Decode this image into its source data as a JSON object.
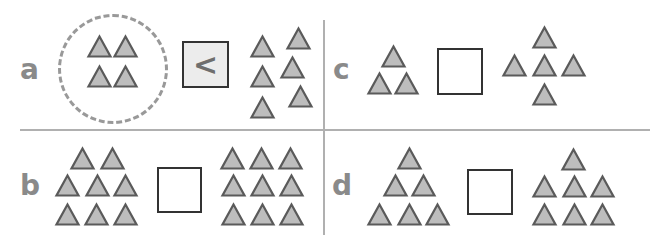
{
  "colors": {
    "triangle_fill": "#bdbdbd",
    "triangle_stroke": "#5a5a5a",
    "label": "#8a8a8a",
    "divider": "#b0b0b0",
    "box_border": "#333333",
    "filled_box_bg": "#ececec"
  },
  "panels": [
    {
      "label": "a",
      "left_count": 4,
      "right_count": 6,
      "answer": "<"
    },
    {
      "label": "b",
      "left_count": 8,
      "right_count": 9,
      "answer": ""
    },
    {
      "label": "c",
      "left_count": 3,
      "right_count": 5,
      "answer": ""
    },
    {
      "label": "d",
      "left_count": 6,
      "right_count": 7,
      "answer": ""
    }
  ]
}
